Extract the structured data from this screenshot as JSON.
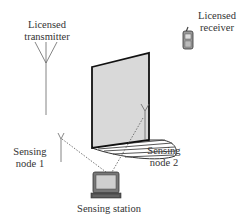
{
  "labels": {
    "transmitter_line1": "Licensed",
    "transmitter_line2": "transmitter",
    "receiver_line1": "Licensed",
    "receiver_line2": "receiver",
    "node1_line1": "Sensing",
    "node1_line2": "node 1",
    "node2_line1": "Sensing",
    "node2_line2": "node 2",
    "station": "Sensing station"
  },
  "colors": {
    "wall_fill": "#d9d9d9",
    "wall_stroke": "#111111",
    "line": "#555555",
    "text": "#333333"
  }
}
